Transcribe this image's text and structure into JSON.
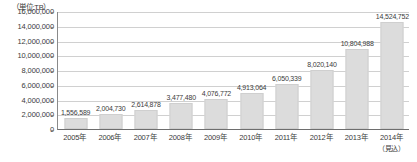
{
  "chart_data": {
    "type": "bar",
    "title": "",
    "unit_caption": "（単位:TB）",
    "xlabel": "",
    "ylabel": "",
    "ylim": [
      0,
      16000000
    ],
    "ytick_step": 2000000,
    "grid": true,
    "legend": "none",
    "categories": [
      "2005年",
      "2006年",
      "2007年",
      "2008年",
      "2009年",
      "2010年",
      "2011年",
      "2012年",
      "2013年",
      "2014年"
    ],
    "category_notes": [
      "",
      "",
      "",
      "",
      "",
      "",
      "",
      "",
      "",
      "（見込）"
    ],
    "values": [
      1556589,
      2004730,
      2614878,
      3477480,
      4076772,
      4913064,
      6050339,
      8020140,
      10804988,
      14524752
    ],
    "value_labels": [
      "1,556,589",
      "2,004,730",
      "2,614,878",
      "3,477,480",
      "4,076,772",
      "4,913,064",
      "6,050,339",
      "8,020,140",
      "10,804,988",
      "14,524,752"
    ],
    "ytick_labels": [
      "16,000,000",
      "14,000,000",
      "12,000,000",
      "10,000,000",
      "8,000,000",
      "6,000,000",
      "4,000,000",
      "2,000,000",
      "0"
    ],
    "ytick_values": [
      16000000,
      14000000,
      12000000,
      10000000,
      8000000,
      6000000,
      4000000,
      2000000,
      0
    ],
    "colors": {
      "bar_fill": "#dcdcdc",
      "bar_stroke": "#cfcfcf",
      "gridline": "#d0d0d0",
      "axis": "#6e6e6e",
      "text": "#3b3b3b",
      "background": "#ffffff"
    }
  }
}
